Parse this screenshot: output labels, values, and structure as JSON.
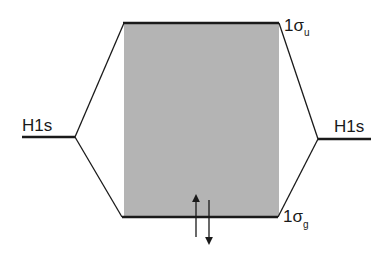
{
  "diagram": {
    "title": "",
    "left_atomic_orbital": {
      "label": "H1s"
    },
    "right_atomic_orbital": {
      "label": "H1s"
    },
    "antibonding_orbital": {
      "label_main": "1σ",
      "label_sub": "u"
    },
    "bonding_orbital": {
      "label_main": "1σ",
      "label_sub": "g"
    },
    "electrons": {
      "up": "↑",
      "down": "↓",
      "count": 2
    },
    "colors": {
      "shade": "#b4b4b4",
      "line": "#1a1a1a"
    }
  }
}
